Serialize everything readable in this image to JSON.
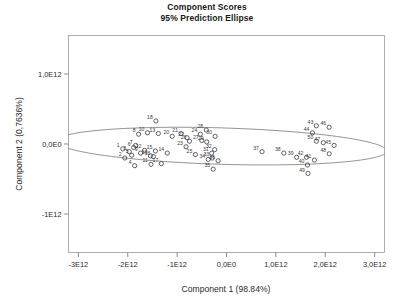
{
  "title": {
    "line1": "Component Scores",
    "line2": "95% Prediction Ellipse"
  },
  "chart_data": {
    "type": "scatter",
    "title": "Component Scores 95% Prediction Ellipse",
    "xlabel": "Component 1 (98.84%)",
    "ylabel": "Component 2 (0,7636%)",
    "xlim": [
      -3200000000000.0,
      3200000000000.0
    ],
    "ylim": [
      -1550000000000.0,
      1550000000000.0
    ],
    "grid": false,
    "legend": null,
    "xticks": [
      -3000000000000.0,
      -2000000000000.0,
      -1000000000000.0,
      0,
      1000000000000.0,
      2000000000000.0,
      3000000000000.0
    ],
    "xticklabels": [
      "-3E12",
      "-2E12",
      "-1E12",
      "0,0E0",
      "1,0E12",
      "2,0E12",
      "3,0E12"
    ],
    "yticks": [
      1000000000000.0,
      0,
      -1000000000000.0
    ],
    "yticklabels": [
      "1,0E12",
      "0,0E0",
      "-1E12"
    ],
    "marker": "open-circle",
    "annotation": "95% prediction ellipse drawn around all observations",
    "ellipse": {
      "center_x": -100000000000.0,
      "center_y": -30000000000.0,
      "semi_major": 3350000000000.0,
      "semi_minor": 260000000000.0,
      "rotation_deg": -1.2
    },
    "points": [
      {
        "label": "1",
        "x": -2100000000000.0,
        "y": -70000000000.0
      },
      {
        "label": "2",
        "x": -2060000000000.0,
        "y": -200000000000.0
      },
      {
        "label": "3",
        "x": -1970000000000.0,
        "y": -110000000000.0
      },
      {
        "label": "4",
        "x": -1860000000000.0,
        "y": -310000000000.0
      },
      {
        "label": "5",
        "x": -1920000000000.0,
        "y": -160000000000.0
      },
      {
        "label": "6",
        "x": -1880000000000.0,
        "y": -50000000000.0
      },
      {
        "label": "7",
        "x": -1840000000000.0,
        "y": -20000000000.0
      },
      {
        "label": "8",
        "x": -1780000000000.0,
        "y": 140000000000.0
      },
      {
        "label": "9",
        "x": -1740000000000.0,
        "y": -130000000000.0
      },
      {
        "label": "10",
        "x": -1600000000000.0,
        "y": 160000000000.0
      },
      {
        "label": "11",
        "x": -1530000000000.0,
        "y": -290000000000.0
      },
      {
        "label": "12",
        "x": -1660000000000.0,
        "y": -90000000000.0
      },
      {
        "label": "13",
        "x": -1380000000000.0,
        "y": 150000000000.0
      },
      {
        "label": "14",
        "x": -1200000000000.0,
        "y": -130000000000.0
      },
      {
        "label": "15",
        "x": -1440000000000.0,
        "y": -100000000000.0
      },
      {
        "label": "16",
        "x": -1480000000000.0,
        "y": -180000000000.0
      },
      {
        "label": "17",
        "x": -1320000000000.0,
        "y": -280000000000.0
      },
      {
        "label": "18",
        "x": -1430000000000.0,
        "y": 330000000000.0
      },
      {
        "label": "19",
        "x": -1540000000000.0,
        "y": -170000000000.0
      },
      {
        "label": "20",
        "x": -1100000000000.0,
        "y": 110000000000.0
      },
      {
        "label": "21",
        "x": -920000000000.0,
        "y": 150000000000.0
      },
      {
        "label": "22",
        "x": -800000000000.0,
        "y": 90000000000.0
      },
      {
        "label": "23",
        "x": -820000000000.0,
        "y": -40000000000.0
      },
      {
        "label": "24",
        "x": -530000000000.0,
        "y": 140000000000.0
      },
      {
        "label": "25",
        "x": -630000000000.0,
        "y": -150000000000.0
      },
      {
        "label": "26",
        "x": -750000000000.0,
        "y": 40000000000.0
      },
      {
        "label": "27",
        "x": -500000000000.0,
        "y": 50000000000.0
      },
      {
        "label": "28",
        "x": -410000000000.0,
        "y": 200000000000.0
      },
      {
        "label": "29",
        "x": -400000000000.0,
        "y": 30000000000.0
      },
      {
        "label": "30",
        "x": -230000000000.0,
        "y": 110000000000.0
      },
      {
        "label": "31",
        "x": -300000000000.0,
        "y": -130000000000.0
      },
      {
        "label": "32",
        "x": -240000000000.0,
        "y": -80000000000.0
      },
      {
        "label": "33",
        "x": -290000000000.0,
        "y": -200000000000.0
      },
      {
        "label": "34",
        "x": -370000000000.0,
        "y": -220000000000.0
      },
      {
        "label": "35",
        "x": -270000000000.0,
        "y": -360000000000.0
      },
      {
        "label": "36",
        "x": -170000000000.0,
        "y": -240000000000.0
      },
      {
        "label": "37",
        "x": 720000000000.0,
        "y": -110000000000.0
      },
      {
        "label": "38",
        "x": 1160000000000.0,
        "y": -130000000000.0
      },
      {
        "label": "39",
        "x": 1420000000000.0,
        "y": -190000000000.0
      },
      {
        "label": "40",
        "x": 1640000000000.0,
        "y": -300000000000.0
      },
      {
        "label": "41",
        "x": 1780000000000.0,
        "y": -230000000000.0
      },
      {
        "label": "42",
        "x": 1620000000000.0,
        "y": -190000000000.0
      },
      {
        "label": "43",
        "x": 1820000000000.0,
        "y": 260000000000.0
      },
      {
        "label": "44",
        "x": 1740000000000.0,
        "y": 160000000000.0
      },
      {
        "label": "45",
        "x": 2180000000000.0,
        "y": -20000000000.0
      },
      {
        "label": "46",
        "x": 2080000000000.0,
        "y": 240000000000.0
      },
      {
        "label": "47",
        "x": 1960000000000.0,
        "y": 20000000000.0
      },
      {
        "label": "48",
        "x": 2080000000000.0,
        "y": -140000000000.0
      },
      {
        "label": "49",
        "x": 1650000000000.0,
        "y": -420000000000.0
      },
      {
        "label": "50",
        "x": 1820000000000.0,
        "y": 40000000000.0
      }
    ]
  }
}
